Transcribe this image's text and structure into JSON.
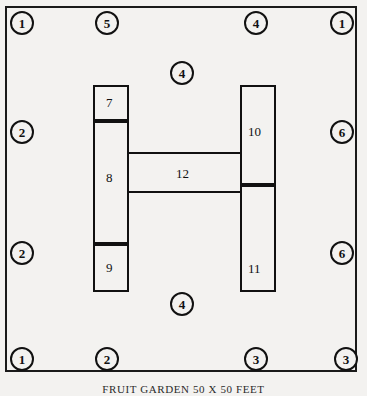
{
  "caption": "FRUIT GARDEN 50 X 50 FEET",
  "plan": {
    "title": "Fruit Garden Planting Plan",
    "outline_color": "#111111",
    "background_color": "#f3f2f0"
  },
  "markers": [
    {
      "label": "1",
      "position": "top-left",
      "x": 10,
      "y": 11
    },
    {
      "label": "5",
      "position": "top-center-left",
      "x": 95,
      "y": 11
    },
    {
      "label": "4",
      "position": "top-center-right",
      "x": 244,
      "y": 11
    },
    {
      "label": "1",
      "position": "top-right",
      "x": 330,
      "y": 11
    },
    {
      "label": "4",
      "position": "center-upper",
      "x": 170,
      "y": 61
    },
    {
      "label": "2",
      "position": "left-upper",
      "x": 10,
      "y": 120
    },
    {
      "label": "6",
      "position": "right-upper",
      "x": 330,
      "y": 120
    },
    {
      "label": "2",
      "position": "left-lower",
      "x": 10,
      "y": 241
    },
    {
      "label": "6",
      "position": "right-lower",
      "x": 330,
      "y": 241
    },
    {
      "label": "4",
      "position": "center-lower",
      "x": 170,
      "y": 292
    },
    {
      "label": "1",
      "position": "bottom-left",
      "x": 10,
      "y": 347
    },
    {
      "label": "2",
      "position": "bottom-center-left",
      "x": 95,
      "y": 347
    },
    {
      "label": "3",
      "position": "bottom-center-right",
      "x": 244,
      "y": 347
    },
    {
      "label": "3",
      "position": "bottom-right",
      "x": 334,
      "y": 347
    }
  ],
  "beds": [
    {
      "label": "7",
      "name": "bed-7",
      "x": 93,
      "y": 85,
      "w": 36,
      "h": 36,
      "lx": 106,
      "ly": 96
    },
    {
      "label": "8",
      "name": "bed-8",
      "x": 93,
      "y": 121,
      "w": 36,
      "h": 123,
      "lx": 106,
      "ly": 171
    },
    {
      "label": "9",
      "name": "bed-9",
      "x": 93,
      "y": 244,
      "w": 36,
      "h": 48,
      "lx": 106,
      "ly": 261
    },
    {
      "label": "10",
      "name": "bed-10",
      "x": 240,
      "y": 85,
      "w": 36,
      "h": 100,
      "lx": 248,
      "ly": 125
    },
    {
      "label": "11",
      "name": "bed-11",
      "x": 240,
      "y": 185,
      "w": 36,
      "h": 107,
      "lx": 248,
      "ly": 262
    },
    {
      "label": "12",
      "name": "bed-12",
      "x": 127,
      "y": 152,
      "w": 115,
      "h": 41,
      "lx": 176,
      "ly": 167
    }
  ],
  "legend_numbers": [
    "1",
    "2",
    "3",
    "4",
    "5",
    "6",
    "7",
    "8",
    "9",
    "10",
    "11",
    "12"
  ]
}
